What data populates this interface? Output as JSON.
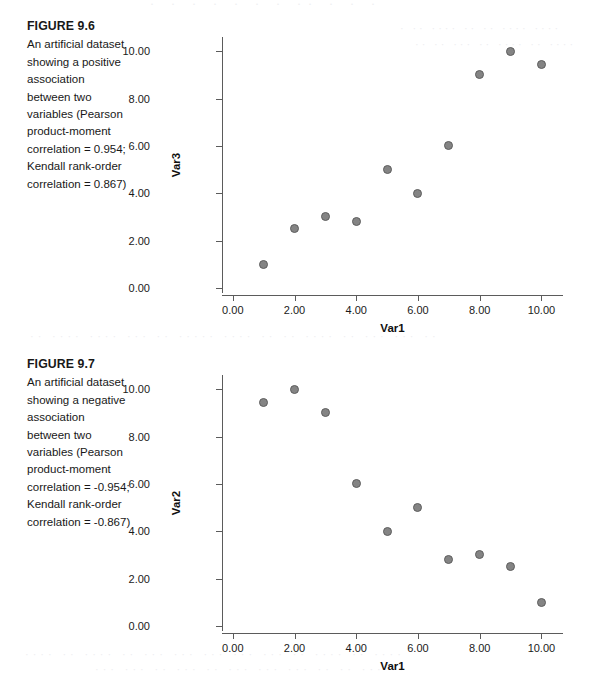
{
  "page": {
    "background": "#ffffff",
    "marker_color": "#848484",
    "marker_border_color": "#5e5e5e",
    "axis_color": "#5b5b5b"
  },
  "bleed_through": {
    "top": "· · ·  · · ·   ·  ··   ·    ·   ·",
    "fig1_a": "· ·· ···· ·· ·· ···· ····",
    "fig1_b": "·· ·· ··· ·· ···· ·· ····",
    "middle": "·· ···· ···· ··· ·· ····· ···· ·· ·· ···· ·· ··· ··· ··",
    "bottom_a": "···· ·· ···· ·· ··· ··· ···  ···  ··· ·· ···· ·· ····",
    "bottom_b": "··· ··· ·· ··· ··   ··· ··· ···  ·· ·· ··· ··"
  },
  "figures": [
    {
      "caption": {
        "title": "FIGURE 9.6",
        "body": "An artificial dataset showing a positive association between two variables (Pearson product-moment correlation = 0.954; Kendall rank-order correlation = 0.867)"
      },
      "chart_data": {
        "type": "scatter",
        "title": "",
        "xlabel": "Var1",
        "ylabel": "Var3",
        "xlim": [
          -0.35,
          10.7
        ],
        "ylim": [
          -0.3,
          10.6
        ],
        "xticks": [
          0,
          2,
          4,
          6,
          8,
          10
        ],
        "yticks": [
          0,
          2,
          4,
          6,
          8,
          10
        ],
        "xticklabels": [
          "0.00",
          "2.00",
          "4.00",
          "6.00",
          "8.00",
          "10.00"
        ],
        "yticklabels": [
          "0.00",
          "2.00",
          "4.00",
          "6.00",
          "8.00",
          "10.00"
        ],
        "grid": false,
        "legend": false,
        "x": [
          1,
          2,
          3,
          4,
          5,
          6,
          7,
          8,
          9,
          10
        ],
        "y": [
          1.0,
          2.5,
          3.0,
          2.8,
          5.0,
          4.0,
          6.0,
          9.0,
          10.0,
          9.45
        ]
      }
    },
    {
      "caption": {
        "title": "FIGURE 9.7",
        "body": "An artificial dataset showing a negative association between two variables (Pearson product-moment correlation = -0.954; Kendall rank-order correlation = -0.867)"
      },
      "chart_data": {
        "type": "scatter",
        "title": "",
        "xlabel": "Var1",
        "ylabel": "Var2",
        "xlim": [
          -0.35,
          10.7
        ],
        "ylim": [
          -0.3,
          10.6
        ],
        "xticks": [
          0,
          2,
          4,
          6,
          8,
          10
        ],
        "yticks": [
          0,
          2,
          4,
          6,
          8,
          10
        ],
        "xticklabels": [
          "0.00",
          "2.00",
          "4.00",
          "6.00",
          "8.00",
          "10.00"
        ],
        "yticklabels": [
          "0.00",
          "2.00",
          "4.00",
          "6.00",
          "8.00",
          "10.00"
        ],
        "grid": false,
        "legend": false,
        "x": [
          1,
          2,
          3,
          4,
          5,
          6,
          7,
          8,
          9,
          10
        ],
        "y": [
          9.45,
          10.0,
          9.0,
          6.0,
          4.0,
          5.0,
          2.8,
          3.0,
          2.5,
          1.0
        ]
      }
    }
  ]
}
